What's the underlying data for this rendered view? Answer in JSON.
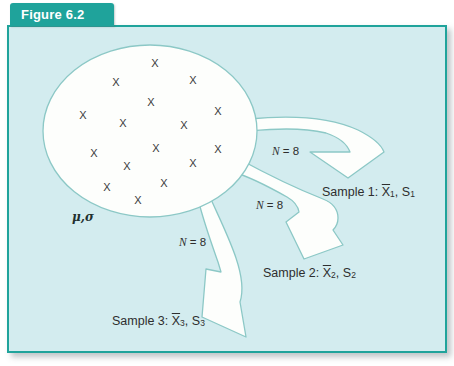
{
  "figure": {
    "tab_label": "Figure 6.2"
  },
  "population": {
    "symbol_label": "μ,σ",
    "x_glyph": "X",
    "x_positions": [
      [
        146,
        36
      ],
      [
        107,
        55
      ],
      [
        184,
        53
      ],
      [
        142,
        75
      ],
      [
        74,
        88
      ],
      [
        209,
        84
      ],
      [
        114,
        96
      ],
      [
        175,
        98
      ],
      [
        147,
        121
      ],
      [
        209,
        122
      ],
      [
        85,
        126
      ],
      [
        118,
        139
      ],
      [
        184,
        136
      ],
      [
        98,
        160
      ],
      [
        155,
        156
      ],
      [
        129,
        173
      ]
    ]
  },
  "arrows": [
    {
      "n_italic": "N",
      "n_rest": " = 8"
    },
    {
      "n_italic": "N",
      "n_rest": " = 8"
    },
    {
      "n_italic": "N",
      "n_rest": " = 8"
    }
  ],
  "samples": [
    {
      "prefix": "Sample 1: ",
      "xbar": "X",
      "x_sub": "1",
      "mid": ", S",
      "s_sub": "1"
    },
    {
      "prefix": "Sample 2: ",
      "xbar": "X",
      "x_sub": "2",
      "mid": ", S",
      "s_sub": "2"
    },
    {
      "prefix": "Sample 3: ",
      "xbar": "X",
      "x_sub": "3",
      "mid": ", S",
      "s_sub": "3"
    }
  ],
  "colors": {
    "teal": "#1fa39b",
    "panel_bg": "#d3ecef",
    "outline_light_teal": "#8cc8c6",
    "text": "#2e2e2e"
  }
}
